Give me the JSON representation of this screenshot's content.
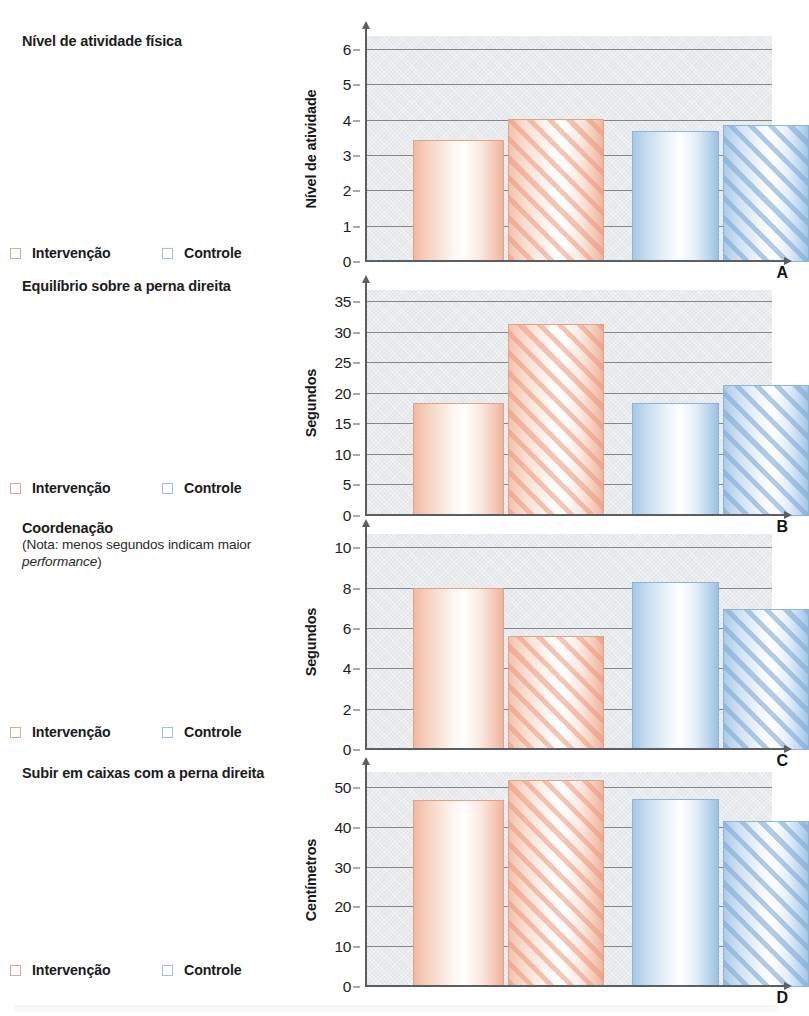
{
  "document": {
    "language": "pt-BR",
    "legend_labels": {
      "intervention": "Intervenção",
      "control": "Controle"
    },
    "colors": {
      "intervention": "#ef9679",
      "control": "#7eaad6",
      "plot_background": "#e3e6e8",
      "gridline": "#6b7074",
      "axis": "#5a5f63",
      "text": "#1a1a1a"
    }
  },
  "panels": [
    {
      "letter": "A",
      "title": "Nível de atividade física",
      "note": "",
      "legend": {
        "intervention": "Intervenção",
        "control": "Controle"
      }
    },
    {
      "letter": "B",
      "title": "Equilíbrio sobre a perna direita",
      "note": "",
      "legend": {
        "intervention": "Intervenção",
        "control": "Controle"
      }
    },
    {
      "letter": "C",
      "title": "Coordenação",
      "note": "(Nota: menos segundos indicam maior performance)",
      "note_italic_word": "performance",
      "legend": {
        "intervention": "Intervenção",
        "control": "Controle"
      }
    },
    {
      "letter": "D",
      "title": "Subir em caixas com a perna direita",
      "note": "",
      "legend": {
        "intervention": "Intervenção",
        "control": "Controle"
      }
    }
  ],
  "chart_data": [
    {
      "type": "bar",
      "title": "Nível de atividade física",
      "panel": "A",
      "ylabel": "Nível de atividade",
      "xlabel": "",
      "ylim": [
        0,
        6.4
      ],
      "yticks": [
        0,
        1,
        2,
        3,
        4,
        5,
        6
      ],
      "ytick_labels": [
        "0",
        "1",
        "2",
        "3",
        "4",
        "5",
        "6"
      ],
      "grid": true,
      "legend": [
        "Intervenção",
        "Controle"
      ],
      "legend_position": "left-outside",
      "groups": [
        "Intervenção",
        "Controle"
      ],
      "bars": [
        {
          "group": "Intervenção",
          "series": "Pré",
          "fill": "solid",
          "color": "#ef9679",
          "value": 3.45
        },
        {
          "group": "Intervenção",
          "series": "Pós",
          "fill": "hatch",
          "color": "#ef9679",
          "value": 4.05
        },
        {
          "group": "Controle",
          "series": "Pré",
          "fill": "solid",
          "color": "#7eaad6",
          "value": 3.72
        },
        {
          "group": "Controle",
          "series": "Pós",
          "fill": "hatch",
          "color": "#7eaad6",
          "value": 3.88
        }
      ],
      "values": [
        3.45,
        4.05,
        3.72,
        3.88
      ]
    },
    {
      "type": "bar",
      "title": "Equilíbrio sobre a perna direita",
      "panel": "B",
      "ylabel": "Segundos",
      "xlabel": "",
      "ylim": [
        0,
        37
      ],
      "yticks": [
        0,
        5,
        10,
        15,
        20,
        25,
        30,
        35
      ],
      "ytick_labels": [
        "0",
        "5",
        "10",
        "15",
        "20",
        "25",
        "30",
        "35"
      ],
      "grid": true,
      "legend": [
        "Intervenção",
        "Controle"
      ],
      "legend_position": "left-outside",
      "groups": [
        "Intervenção",
        "Controle"
      ],
      "bars": [
        {
          "group": "Intervenção",
          "series": "Pré",
          "fill": "solid",
          "color": "#ef9679",
          "value": 18.5
        },
        {
          "group": "Intervenção",
          "series": "Pós",
          "fill": "hatch",
          "color": "#ef9679",
          "value": 31.5
        },
        {
          "group": "Controle",
          "series": "Pré",
          "fill": "solid",
          "color": "#7eaad6",
          "value": 18.5
        },
        {
          "group": "Controle",
          "series": "Pós",
          "fill": "hatch",
          "color": "#7eaad6",
          "value": 21.5
        }
      ],
      "values": [
        18.5,
        31.5,
        18.5,
        21.5
      ]
    },
    {
      "type": "bar",
      "title": "Coordenação",
      "panel": "C",
      "ylabel": "Segundos",
      "xlabel": "",
      "ylim": [
        0,
        10.7
      ],
      "yticks": [
        0,
        2,
        4,
        6,
        8,
        10
      ],
      "ytick_labels": [
        "0",
        "2",
        "4",
        "6",
        "8",
        "10"
      ],
      "grid": true,
      "legend": [
        "Intervenção",
        "Controle"
      ],
      "legend_position": "left-outside",
      "annotation": "(Nota: menos segundos indicam maior performance)",
      "groups": [
        "Intervenção",
        "Controle"
      ],
      "bars": [
        {
          "group": "Intervenção",
          "series": "Pré",
          "fill": "solid",
          "color": "#ef9679",
          "value": 8.05
        },
        {
          "group": "Intervenção",
          "series": "Pós",
          "fill": "hatch",
          "color": "#ef9679",
          "value": 5.65
        },
        {
          "group": "Controle",
          "series": "Pré",
          "fill": "solid",
          "color": "#7eaad6",
          "value": 8.3
        },
        {
          "group": "Controle",
          "series": "Pós",
          "fill": "hatch",
          "color": "#7eaad6",
          "value": 7.0
        }
      ],
      "values": [
        8.05,
        5.65,
        8.3,
        7.0
      ]
    },
    {
      "type": "bar",
      "title": "Subir em caixas com a perna direita",
      "panel": "D",
      "ylabel": "Centímetros",
      "xlabel": "",
      "ylim": [
        0,
        54
      ],
      "yticks": [
        0,
        10,
        20,
        30,
        40,
        50
      ],
      "ytick_labels": [
        "0",
        "10",
        "20",
        "30",
        "40",
        "50"
      ],
      "grid": true,
      "legend": [
        "Intervenção",
        "Controle"
      ],
      "legend_position": "left-outside",
      "groups": [
        "Intervenção",
        "Controle"
      ],
      "bars": [
        {
          "group": "Intervenção",
          "series": "Pré",
          "fill": "solid",
          "color": "#ef9679",
          "value": 47.0
        },
        {
          "group": "Intervenção",
          "series": "Pós",
          "fill": "hatch",
          "color": "#ef9679",
          "value": 52.0
        },
        {
          "group": "Controle",
          "series": "Pré",
          "fill": "solid",
          "color": "#7eaad6",
          "value": 47.3
        },
        {
          "group": "Controle",
          "series": "Pós",
          "fill": "hatch",
          "color": "#7eaad6",
          "value": 41.7
        }
      ],
      "values": [
        47.0,
        52.0,
        47.3,
        41.7
      ]
    }
  ]
}
